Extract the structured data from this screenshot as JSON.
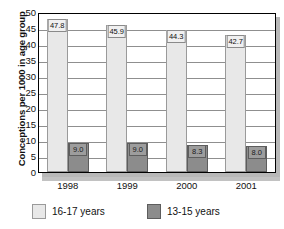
{
  "chart_data": {
    "type": "bar",
    "title": "",
    "xlabel": "",
    "ylabel": "Conceptions per 1000 in age group",
    "categories": [
      "1998",
      "1999",
      "2000",
      "2001"
    ],
    "ylim": [
      0,
      50
    ],
    "yticks": [
      0,
      5,
      10,
      15,
      20,
      25,
      30,
      35,
      40,
      45,
      50
    ],
    "ytick_labels": [
      "0",
      "5",
      "10",
      "15",
      "20",
      "25",
      "30",
      "35",
      "40",
      "45",
      "50"
    ],
    "grid": true,
    "legend_position": "bottom",
    "series": [
      {
        "name": "16-17 years",
        "color": "#e8e8e8",
        "values": [
          47.8,
          45.9,
          44.3,
          42.7
        ],
        "value_labels": [
          "47.8",
          "45.9",
          "44.3",
          "42.7"
        ]
      },
      {
        "name": "13-15 years",
        "color": "#8c8c8c",
        "values": [
          9.0,
          9.0,
          8.3,
          8.0
        ],
        "value_labels": [
          "9.0",
          "9.0",
          "8.3",
          "8.0"
        ]
      }
    ]
  }
}
